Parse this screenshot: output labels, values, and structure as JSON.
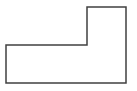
{
  "diagram": {
    "type": "outline-shape",
    "shape": "L-shape",
    "stroke_color": "#404040",
    "fill_color": "#ffffff",
    "stroke_width": 1.5,
    "points": "6,45 87,45 87,7 126,7 126,83 6,83"
  }
}
